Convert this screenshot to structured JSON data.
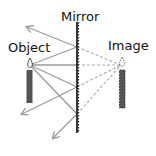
{
  "labels": {
    "mirror": "Mirror",
    "object": "Object",
    "image": "Image"
  },
  "colors": {
    "ray": "#9a9a9a",
    "candle": "#555555",
    "mirror": "#222222",
    "text": "#111111"
  }
}
